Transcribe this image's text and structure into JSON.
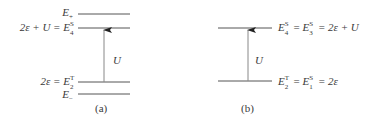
{
  "panels": [
    {
      "id": "a",
      "caption": "(a)",
      "levels": [
        {
          "name": "E_plus",
          "lhs": "",
          "symbol": "E",
          "sup": "",
          "sub": "+",
          "y": 14
        },
        {
          "name": "E4S",
          "lhs": "2ε + U = ",
          "symbol": "E",
          "sup": "S",
          "sub": "4",
          "y": 28
        },
        {
          "name": "E2T",
          "lhs": "2ε = ",
          "symbol": "E",
          "sup": "T",
          "sub": "2",
          "y": 82
        },
        {
          "name": "E_minus",
          "lhs": "",
          "symbol": "E",
          "sup": "",
          "sub": "−",
          "y": 94
        }
      ],
      "arrow_label": "U"
    },
    {
      "id": "b",
      "caption": "(b)",
      "levels": [
        {
          "name": "E4S_E3S",
          "text_parts": [
            "E",
            "S",
            "4",
            " = ",
            "E",
            "S",
            "3",
            " = 2ε + U"
          ],
          "y": 28
        },
        {
          "name": "E2T_E1S",
          "text_parts": [
            "E",
            "T",
            "2",
            " = ",
            "E",
            "S",
            "1",
            " = 2ε"
          ],
          "y": 81
        }
      ],
      "arrow_label": "U"
    }
  ],
  "labels": {
    "a_eplus_sub": "+",
    "a_e4_lhs": "2ε + U = ",
    "a_e4_sup": "S",
    "a_e4_sub": "4",
    "a_e2_lhs": "2ε = ",
    "a_e2_sup": "T",
    "a_e2_sub": "2",
    "a_eminus_sub": "−",
    "E": "E",
    "U": "U",
    "cap_a": "(a)",
    "cap_b": "(b)",
    "b_top_sup1": "S",
    "b_top_sub1": "4",
    "b_top_eq": " = ",
    "b_top_sup2": "S",
    "b_top_sub2": "3",
    "b_top_rhs": " = 2ε + U",
    "b_bot_sup1": "T",
    "b_bot_sub1": "2",
    "b_bot_eq": " = ",
    "b_bot_sup2": "S",
    "b_bot_sub2": "1",
    "b_bot_rhs": " = 2ε"
  },
  "colors": {
    "line": "#555555",
    "arrow": "#888888",
    "text": "#3a3a3a"
  }
}
